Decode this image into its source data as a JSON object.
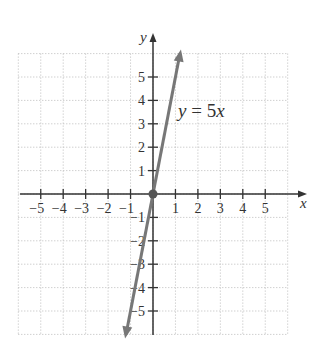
{
  "chart_data": {
    "type": "line",
    "title": "",
    "xlabel": "x",
    "ylabel": "y",
    "xlim": [
      -6,
      6
    ],
    "ylim": [
      -6,
      6
    ],
    "grid": true,
    "x_ticks": [
      -5,
      -4,
      -3,
      -2,
      -1,
      1,
      2,
      3,
      4,
      5
    ],
    "y_ticks": [
      -5,
      -4,
      -3,
      -2,
      -1,
      1,
      2,
      3,
      4,
      5
    ],
    "x_tick_labels": [
      "−5",
      "−4",
      "−3",
      "−2",
      "−1",
      "1",
      "2",
      "3",
      "4",
      "5"
    ],
    "y_tick_labels": [
      "−5",
      "−4",
      "−3",
      "−2",
      "−1",
      "1",
      "2",
      "3",
      "4",
      "5"
    ],
    "series": [
      {
        "name": "y = 5x",
        "equation": "y = 5x",
        "slope": 5,
        "intercept": 0,
        "x": [
          -1.2,
          1.2
        ],
        "y": [
          -6,
          6
        ],
        "marked_points": [
          {
            "x": 0,
            "y": 0
          }
        ],
        "arrows_both_ends": true,
        "color": "#777777"
      }
    ],
    "annotations": [
      {
        "text": "y = 5x",
        "x": 1.1,
        "y": 3.6
      }
    ]
  },
  "labels": {
    "x_axis": "x",
    "y_axis": "y",
    "equation_prefix": "y",
    "equation_eq": " = 5",
    "equation_suffix": "x"
  },
  "colors": {
    "axis": "#333333",
    "grid": "#bbbbbb",
    "line": "#777777",
    "point": "#555555"
  }
}
